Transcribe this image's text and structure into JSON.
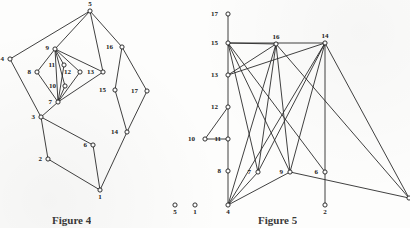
{
  "figures": [
    {
      "id": "figure-4",
      "caption": "Figure 4",
      "node_radius": 2.1,
      "nodes": [
        {
          "id": "5",
          "x": 90,
          "y": 11,
          "label": "5",
          "label_dx": 0,
          "label_dy": -5
        },
        {
          "id": "4",
          "x": 10,
          "y": 59,
          "label": "4",
          "label_dx": -6,
          "label_dy": 2
        },
        {
          "id": "9",
          "x": 55,
          "y": 49,
          "label": "9",
          "label_dx": -6,
          "label_dy": 1
        },
        {
          "id": "8",
          "x": 37,
          "y": 72,
          "label": "8",
          "label_dx": -6,
          "label_dy": 2
        },
        {
          "id": "11",
          "x": 64,
          "y": 65,
          "label": "11",
          "label_dx": -9,
          "label_dy": 2
        },
        {
          "id": "12",
          "x": 80,
          "y": 72,
          "label": "12",
          "label_dx": -9,
          "label_dy": 2
        },
        {
          "id": "13",
          "x": 103,
          "y": 72,
          "label": "13",
          "label_dx": -9,
          "label_dy": 2
        },
        {
          "id": "10",
          "x": 65,
          "y": 86,
          "label": "10",
          "label_dx": -9,
          "label_dy": 2
        },
        {
          "id": "7",
          "x": 58,
          "y": 102,
          "label": "7",
          "label_dx": -6,
          "label_dy": 2
        },
        {
          "id": "3",
          "x": 41,
          "y": 117,
          "label": "3",
          "label_dx": -6,
          "label_dy": 2
        },
        {
          "id": "2",
          "x": 48,
          "y": 159,
          "label": "2",
          "label_dx": -6,
          "label_dy": 2
        },
        {
          "id": "6",
          "x": 93,
          "y": 145,
          "label": "6",
          "label_dx": -6,
          "label_dy": 2
        },
        {
          "id": "1",
          "x": 100,
          "y": 190,
          "label": "1",
          "label_dx": 0,
          "label_dy": 9
        },
        {
          "id": "16",
          "x": 122,
          "y": 47,
          "label": "16",
          "label_dx": -9,
          "label_dy": 2
        },
        {
          "id": "15",
          "x": 115,
          "y": 90,
          "label": "15",
          "label_dx": -9,
          "label_dy": 2
        },
        {
          "id": "17",
          "x": 147,
          "y": 91,
          "label": "17",
          "label_dx": -9,
          "label_dy": 2
        },
        {
          "id": "14",
          "x": 127,
          "y": 132,
          "label": "14",
          "label_dx": -9,
          "label_dy": 2
        }
      ],
      "edges": [
        [
          "5",
          "4"
        ],
        [
          "5",
          "9"
        ],
        [
          "5",
          "13"
        ],
        [
          "5",
          "16"
        ],
        [
          "4",
          "3"
        ],
        [
          "9",
          "8"
        ],
        [
          "9",
          "11"
        ],
        [
          "9",
          "12"
        ],
        [
          "9",
          "13"
        ],
        [
          "9",
          "7"
        ],
        [
          "9",
          "10"
        ],
        [
          "8",
          "7"
        ],
        [
          "11",
          "7"
        ],
        [
          "12",
          "7"
        ],
        [
          "13",
          "7"
        ],
        [
          "10",
          "7"
        ],
        [
          "7",
          "3"
        ],
        [
          "3",
          "2"
        ],
        [
          "3",
          "6"
        ],
        [
          "2",
          "1"
        ],
        [
          "6",
          "1"
        ],
        [
          "16",
          "15"
        ],
        [
          "16",
          "17"
        ],
        [
          "15",
          "14"
        ],
        [
          "17",
          "14"
        ],
        [
          "14",
          "1"
        ]
      ]
    },
    {
      "id": "figure-5",
      "caption": "Figure 5",
      "node_radius": 2.1,
      "nodes": [
        {
          "id": "17",
          "x": 228,
          "y": 14,
          "label": "17",
          "label_dx": -10,
          "label_dy": 2
        },
        {
          "id": "15",
          "x": 228,
          "y": 43,
          "label": "15",
          "label_dx": -10,
          "label_dy": 2
        },
        {
          "id": "13",
          "x": 228,
          "y": 75,
          "label": "13",
          "label_dx": -10,
          "label_dy": 2
        },
        {
          "id": "12",
          "x": 228,
          "y": 107,
          "label": "12",
          "label_dx": -10,
          "label_dy": 2
        },
        {
          "id": "8",
          "x": 228,
          "y": 171,
          "label": "8",
          "label_dx": -7,
          "label_dy": 2
        },
        {
          "id": "4",
          "x": 228,
          "y": 205,
          "label": "4",
          "label_dx": 0,
          "label_dy": 9
        },
        {
          "id": "10",
          "x": 205,
          "y": 139,
          "label": "10",
          "label_dx": -10,
          "label_dy": 2
        },
        {
          "id": "11",
          "x": 228,
          "y": 139,
          "label": "11",
          "label_dx": -7,
          "label_dy": 2
        },
        {
          "id": "16",
          "x": 276,
          "y": 44,
          "label": "16",
          "label_dx": 0,
          "label_dy": -5
        },
        {
          "id": "14",
          "x": 325,
          "y": 43,
          "label": "14",
          "label_dx": 0,
          "label_dy": -5
        },
        {
          "id": "7",
          "x": 258,
          "y": 172,
          "label": "7",
          "label_dx": -7,
          "label_dy": 2
        },
        {
          "id": "9",
          "x": 290,
          "y": 172,
          "label": "9",
          "label_dx": -7,
          "label_dy": 2
        },
        {
          "id": "6",
          "x": 325,
          "y": 172,
          "label": "6",
          "label_dx": -7,
          "label_dy": 2
        },
        {
          "id": "2",
          "x": 325,
          "y": 205,
          "label": "2",
          "label_dx": 0,
          "label_dy": 9
        },
        {
          "id": "5",
          "x": 175,
          "y": 205,
          "label": "5",
          "label_dx": 0,
          "label_dy": 9
        },
        {
          "id": "1",
          "x": 195,
          "y": 205,
          "label": "1",
          "label_dx": 0,
          "label_dy": 9
        },
        {
          "id": "3",
          "x": 409,
          "y": 198,
          "label": "",
          "label_dx": 0,
          "label_dy": 0
        }
      ],
      "isolated_nodes": [
        "5",
        "1"
      ],
      "edges": [
        [
          "17",
          "15"
        ],
        [
          "15",
          "13"
        ],
        [
          "13",
          "12"
        ],
        [
          "12",
          "11"
        ],
        [
          "11",
          "8"
        ],
        [
          "8",
          "4"
        ],
        [
          "12",
          "10"
        ],
        [
          "10",
          "11"
        ],
        [
          "15",
          "7"
        ],
        [
          "15",
          "9"
        ],
        [
          "15",
          "6"
        ],
        [
          "15",
          "14"
        ],
        [
          "15",
          "16"
        ],
        [
          "13",
          "16"
        ],
        [
          "13",
          "14"
        ],
        [
          "16",
          "7"
        ],
        [
          "16",
          "9"
        ],
        [
          "16",
          "4"
        ],
        [
          "16",
          "3"
        ],
        [
          "14",
          "7"
        ],
        [
          "14",
          "9"
        ],
        [
          "14",
          "6"
        ],
        [
          "14",
          "4"
        ],
        [
          "14",
          "3"
        ],
        [
          "6",
          "2"
        ],
        [
          "4",
          "7"
        ],
        [
          "4",
          "9"
        ],
        [
          "9",
          "3"
        ]
      ]
    }
  ]
}
